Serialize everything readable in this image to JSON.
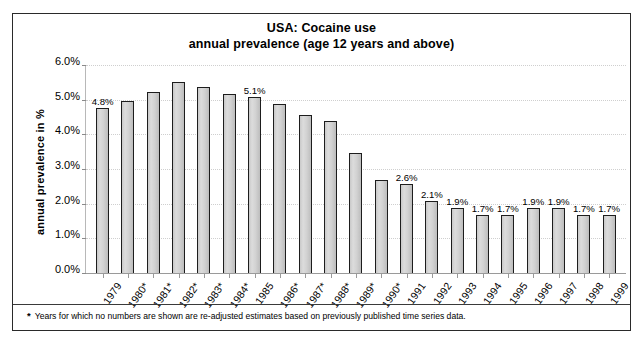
{
  "chart_data": {
    "type": "bar",
    "title": "USA: Cocaine use",
    "subtitle": "annual prevalence (age 12 years and above)",
    "xlabel": "",
    "ylabel": "annual prevalence in %",
    "ylim": [
      0.0,
      6.0
    ],
    "ytick_labels": [
      "0.0%",
      "1.0%",
      "2.0%",
      "3.0%",
      "4.0%",
      "5.0%",
      "6.0%"
    ],
    "ytick_values": [
      0.0,
      1.0,
      2.0,
      3.0,
      4.0,
      5.0,
      6.0
    ],
    "grid": true,
    "legend": null,
    "categories": [
      "1979",
      "1980*",
      "1981*",
      "1982*",
      "1983*",
      "1984*",
      "1985",
      "1986*",
      "1987*",
      "1988*",
      "1989*",
      "1990*",
      "1991",
      "1992",
      "1993",
      "1994",
      "1995",
      "1996",
      "1997",
      "1998",
      "1999"
    ],
    "values": [
      4.8,
      5.0,
      5.25,
      5.55,
      5.4,
      5.2,
      5.1,
      4.9,
      4.6,
      4.4,
      3.5,
      2.7,
      2.6,
      2.1,
      1.9,
      1.7,
      1.7,
      1.9,
      1.9,
      1.7,
      1.7
    ],
    "point_labels": [
      "4.8%",
      "",
      "",
      "",
      "",
      "",
      "5.1%",
      "",
      "",
      "",
      "",
      "",
      "2.6%",
      "2.1%",
      "1.9%",
      "1.7%",
      "1.7%",
      "1.9%",
      "1.9%",
      "1.7%",
      "1.7%"
    ],
    "annotations": [
      "* Years for which no numbers are shown are re-adjusted estimates based on previously published time series data."
    ],
    "bar_fill_color": "#d2d2d2",
    "bar_border_color": "#1d1d1d"
  },
  "footnote": {
    "marker": "*",
    "text": "Years for which no numbers are shown are re-adjusted estimates based on previously published time series data."
  }
}
